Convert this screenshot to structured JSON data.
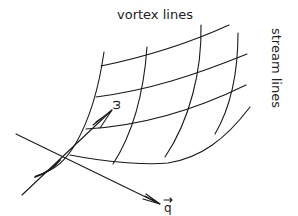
{
  "diagram": {
    "labels": {
      "vortex_lines": "vortex lines",
      "stream_lines": "stream lines",
      "omega_vector": "ω",
      "q_vector": "q"
    },
    "colors": {
      "ink": "#1a1a1a",
      "background": "#ffffff"
    }
  }
}
